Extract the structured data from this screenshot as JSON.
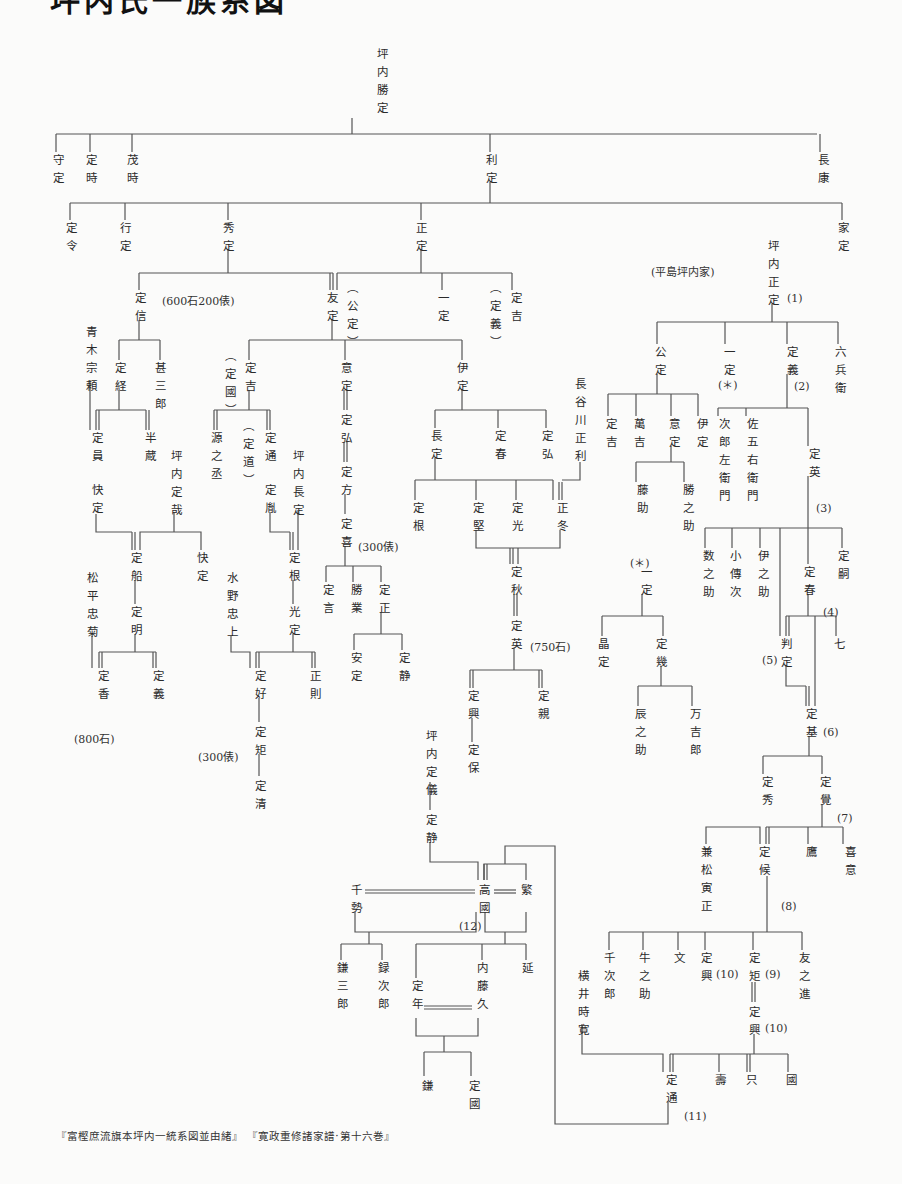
{
  "title": "坪内氏一族系図",
  "footer": "『富樫庶流旗本坪内一統系図並由緒』 『寛政重修諸家譜·第十六巻』",
  "nodes": [
    {
      "id": "katsusada",
      "t": "坪内勝定",
      "x": 376,
      "y": 48
    },
    {
      "id": "morisada",
      "t": "守定",
      "x": 52,
      "y": 154
    },
    {
      "id": "sadatoki",
      "t": "定時",
      "x": 85,
      "y": 154
    },
    {
      "id": "shigetoki",
      "t": "茂時",
      "x": 126,
      "y": 154
    },
    {
      "id": "toshisada",
      "t": "利定",
      "x": 485,
      "y": 154
    },
    {
      "id": "nagayasu",
      "t": "長康",
      "x": 817,
      "y": 154
    },
    {
      "id": "sadanori",
      "t": "定令",
      "x": 65,
      "y": 222
    },
    {
      "id": "yukisada",
      "t": "行定",
      "x": 119,
      "y": 222
    },
    {
      "id": "hidesada",
      "t": "秀定",
      "x": 222,
      "y": 222
    },
    {
      "id": "masasada",
      "t": "正定",
      "x": 415,
      "y": 222
    },
    {
      "id": "iesada",
      "t": "家定",
      "x": 837,
      "y": 222
    },
    {
      "id": "sadanobu",
      "t": "定信",
      "x": 134,
      "y": 292
    },
    {
      "id": "tomosada",
      "t": "友定",
      "x": 326,
      "y": 292
    },
    {
      "id": "kimisada_p",
      "t": "︵公定︶",
      "x": 346,
      "y": 282
    },
    {
      "id": "kazusada",
      "t": "一定",
      "x": 437,
      "y": 292
    },
    {
      "id": "sadayoshi_p",
      "t": "︵定義︶",
      "x": 489,
      "y": 282
    },
    {
      "id": "sadayoshi2",
      "t": "定吉",
      "x": 510,
      "y": 292
    },
    {
      "id": "aoki",
      "t": "青木宗頼",
      "x": 85,
      "y": 326
    },
    {
      "id": "sadatsune",
      "t": "定経",
      "x": 114,
      "y": 362
    },
    {
      "id": "jinzaburo",
      "t": "甚三郎",
      "x": 154,
      "y": 362
    },
    {
      "id": "sadakuni_p",
      "t": "︵定國︶",
      "x": 224,
      "y": 350
    },
    {
      "id": "sadayoshi3",
      "t": "定吉",
      "x": 244,
      "y": 362
    },
    {
      "id": "isada",
      "t": "意定",
      "x": 340,
      "y": 362
    },
    {
      "id": "idasada",
      "t": "伊定",
      "x": 456,
      "y": 362
    },
    {
      "id": "hasegawa",
      "t": "長谷川正利",
      "x": 574,
      "y": 378
    },
    {
      "id": "sadakazu",
      "t": "定員",
      "x": 91,
      "y": 432
    },
    {
      "id": "hanzo",
      "t": "半蔵",
      "x": 144,
      "y": 432
    },
    {
      "id": "gennojo",
      "t": "源之丞",
      "x": 210,
      "y": 432
    },
    {
      "id": "sadamichi_p",
      "t": "︵定道︶",
      "x": 242,
      "y": 420
    },
    {
      "id": "sadamichi",
      "t": "定通",
      "x": 264,
      "y": 432
    },
    {
      "id": "sadahiro1",
      "t": "定弘",
      "x": 340,
      "y": 414
    },
    {
      "id": "nagasada",
      "t": "長定",
      "x": 430,
      "y": 430
    },
    {
      "id": "saharu1",
      "t": "定春",
      "x": 494,
      "y": 430
    },
    {
      "id": "sadahiro2",
      "t": "定弘",
      "x": 541,
      "y": 430
    },
    {
      "id": "tsubouchi_sadachika",
      "t": "坪内定哉",
      "x": 170,
      "y": 450
    },
    {
      "id": "tsubouchi_nagasada",
      "t": "坪内長定",
      "x": 292,
      "y": 450
    },
    {
      "id": "sadakata",
      "t": "定方",
      "x": 340,
      "y": 466
    },
    {
      "id": "kaisada",
      "t": "快定",
      "x": 91,
      "y": 484
    },
    {
      "id": "sadataka",
      "t": "定胤",
      "x": 264,
      "y": 484
    },
    {
      "id": "sadayoshi_k",
      "t": "定喜",
      "x": 340,
      "y": 518
    },
    {
      "id": "sadane1",
      "t": "定根",
      "x": 412,
      "y": 502
    },
    {
      "id": "sadakata2",
      "t": "定堅",
      "x": 472,
      "y": 502
    },
    {
      "id": "sadamitsu",
      "t": "定光",
      "x": 511,
      "y": 502
    },
    {
      "id": "masafuyu",
      "t": "正冬",
      "x": 556,
      "y": 502
    },
    {
      "id": "sadafune",
      "t": "定船",
      "x": 130,
      "y": 552
    },
    {
      "id": "kaisada2",
      "t": "快定",
      "x": 196,
      "y": 552
    },
    {
      "id": "sadane2",
      "t": "定根",
      "x": 288,
      "y": 552
    },
    {
      "id": "sadagen",
      "t": "定言",
      "x": 322,
      "y": 584
    },
    {
      "id": "katsunari",
      "t": "勝業",
      "x": 350,
      "y": 584
    },
    {
      "id": "sadamasa",
      "t": "定正",
      "x": 378,
      "y": 584
    },
    {
      "id": "sadaaki",
      "t": "定秋",
      "x": 510,
      "y": 566
    },
    {
      "id": "matsudaira",
      "t": "松平忠菊",
      "x": 86,
      "y": 572
    },
    {
      "id": "mizuno",
      "t": "水野忠上",
      "x": 226,
      "y": 572
    },
    {
      "id": "sadaaki2",
      "t": "定明",
      "x": 130,
      "y": 606
    },
    {
      "id": "mitsusada",
      "t": "光定",
      "x": 288,
      "y": 606
    },
    {
      "id": "sadahide_e",
      "t": "定英",
      "x": 510,
      "y": 620
    },
    {
      "id": "yasusada",
      "t": "安定",
      "x": 350,
      "y": 652
    },
    {
      "id": "sadashizu",
      "t": "定静",
      "x": 398,
      "y": 652
    },
    {
      "id": "sadaka",
      "t": "定香",
      "x": 97,
      "y": 670
    },
    {
      "id": "sadayoshi4",
      "t": "定義",
      "x": 152,
      "y": 670
    },
    {
      "id": "sadayoshi5",
      "t": "定好",
      "x": 254,
      "y": 670
    },
    {
      "id": "masanori",
      "t": "正則",
      "x": 309,
      "y": 670
    },
    {
      "id": "sadaoki1",
      "t": "定興",
      "x": 467,
      "y": 690
    },
    {
      "id": "sadachika",
      "t": "定親",
      "x": 537,
      "y": 690
    },
    {
      "id": "sadanori2",
      "t": "定矩",
      "x": 254,
      "y": 726
    },
    {
      "id": "sadayasu",
      "t": "定保",
      "x": 467,
      "y": 744
    },
    {
      "id": "tsubouchi_sadanori",
      "t": "坪内定儀",
      "x": 425,
      "y": 730
    },
    {
      "id": "sadakiyo",
      "t": "定清",
      "x": 254,
      "y": 780
    },
    {
      "id": "sadashizu2",
      "t": "定静",
      "x": 425,
      "y": 814
    },
    {
      "id": "chise",
      "t": "千勢",
      "x": 350,
      "y": 884
    },
    {
      "id": "takakuni",
      "t": "高國",
      "x": 478,
      "y": 884
    },
    {
      "id": "shigeru",
      "t": "繁",
      "x": 520,
      "y": 884
    },
    {
      "id": "kamasaburo",
      "t": "鎌三郎",
      "x": 336,
      "y": 962
    },
    {
      "id": "rokujiro",
      "t": "録次郎",
      "x": 377,
      "y": 962
    },
    {
      "id": "naito",
      "t": "内藤久",
      "x": 476,
      "y": 962
    },
    {
      "id": "nobu",
      "t": "延",
      "x": 521,
      "y": 962
    },
    {
      "id": "sadatoshi",
      "t": "定年",
      "x": 411,
      "y": 980
    },
    {
      "id": "kama",
      "t": "鎌",
      "x": 421,
      "y": 1080
    },
    {
      "id": "sadakuni2",
      "t": "定國",
      "x": 468,
      "y": 1080
    },
    {
      "id": "tsubouchi_masasada",
      "t": "坪内正定",
      "x": 767,
      "y": 240
    },
    {
      "id": "kimisada",
      "t": "公定",
      "x": 654,
      "y": 346
    },
    {
      "id": "kazusada2",
      "t": "一定",
      "x": 723,
      "y": 346
    },
    {
      "id": "sadayoshi_h",
      "t": "定義",
      "x": 786,
      "y": 346
    },
    {
      "id": "rokubee",
      "t": "六兵衛",
      "x": 834,
      "y": 346
    },
    {
      "id": "kazusada_star",
      "t": "(＊)",
      "x": 718,
      "y": 376,
      "horiz": true
    },
    {
      "id": "sadayoshi6",
      "t": "定吉",
      "x": 605,
      "y": 418
    },
    {
      "id": "mankichi",
      "t": "萬吉",
      "x": 633,
      "y": 418
    },
    {
      "id": "isada2",
      "t": "意定",
      "x": 668,
      "y": 418
    },
    {
      "id": "idasada2",
      "t": "伊定",
      "x": 696,
      "y": 418
    },
    {
      "id": "jirozaemon",
      "t": "次郎左衛門",
      "x": 718,
      "y": 418
    },
    {
      "id": "sagoemon",
      "t": "佐五右衛門",
      "x": 746,
      "y": 418
    },
    {
      "id": "sadahide",
      "t": "定英",
      "x": 808,
      "y": 448
    },
    {
      "id": "fujisuke",
      "t": "藤助",
      "x": 636,
      "y": 484
    },
    {
      "id": "katsunosuke",
      "t": "勝之助",
      "x": 682,
      "y": 484
    },
    {
      "id": "kazunosuke",
      "t": "数之助",
      "x": 702,
      "y": 550
    },
    {
      "id": "kodenji",
      "t": "小傳次",
      "x": 729,
      "y": 550
    },
    {
      "id": "inosuke",
      "t": "伊之助",
      "x": 757,
      "y": 550
    },
    {
      "id": "saharu2",
      "t": "定春",
      "x": 803,
      "y": 566
    },
    {
      "id": "sadatsugu",
      "t": "定嗣",
      "x": 837,
      "y": 550
    },
    {
      "id": "star_kazusada",
      "t": "一定",
      "x": 640,
      "y": 566
    },
    {
      "id": "masasada2",
      "t": "晶定",
      "x": 597,
      "y": 638
    },
    {
      "id": "sadaiku",
      "t": "定幾",
      "x": 655,
      "y": 638
    },
    {
      "id": "hansada",
      "t": "判定",
      "x": 780,
      "y": 638
    },
    {
      "id": "shichi",
      "t": "七",
      "x": 833,
      "y": 638
    },
    {
      "id": "tatsunosuke",
      "t": "辰之助",
      "x": 634,
      "y": 708
    },
    {
      "id": "mankichiro",
      "t": "万吉郎",
      "x": 689,
      "y": 708
    },
    {
      "id": "sadamoto",
      "t": "定基",
      "x": 805,
      "y": 708
    },
    {
      "id": "sadahide2",
      "t": "定秀",
      "x": 761,
      "y": 776
    },
    {
      "id": "sadasato",
      "t": "定覺",
      "x": 819,
      "y": 776
    },
    {
      "id": "kenmatsu",
      "t": "兼松寅正",
      "x": 700,
      "y": 846
    },
    {
      "id": "sadatoki2",
      "t": "定候",
      "x": 758,
      "y": 846
    },
    {
      "id": "taka",
      "t": "鷹",
      "x": 805,
      "y": 846
    },
    {
      "id": "kii",
      "t": "喜意",
      "x": 844,
      "y": 846
    },
    {
      "id": "senjiro",
      "t": "千次郎",
      "x": 603,
      "y": 952
    },
    {
      "id": "ushinosuke",
      "t": "牛之助",
      "x": 638,
      "y": 952
    },
    {
      "id": "fumi",
      "t": "文",
      "x": 673,
      "y": 952
    },
    {
      "id": "sadaoki2",
      "t": "定興",
      "x": 700,
      "y": 952
    },
    {
      "id": "sadanori3",
      "t": "定矩",
      "x": 748,
      "y": 952
    },
    {
      "id": "tomonoshin",
      "t": "友之進",
      "x": 798,
      "y": 952
    },
    {
      "id": "yokoi",
      "t": "横井時寛",
      "x": 577,
      "y": 970
    },
    {
      "id": "sadaoki3",
      "t": "定興",
      "x": 748,
      "y": 1006
    },
    {
      "id": "sadamichi2",
      "t": "定通",
      "x": 665,
      "y": 1074
    },
    {
      "id": "ju",
      "t": "壽",
      "x": 714,
      "y": 1074
    },
    {
      "id": "tada",
      "t": "只",
      "x": 745,
      "y": 1074
    },
    {
      "id": "kuni",
      "t": "國",
      "x": 785,
      "y": 1074
    }
  ],
  "notes": [
    {
      "t": "(600石200俵)",
      "x": 162,
      "y": 292
    },
    {
      "t": "(平島坪内家)",
      "x": 651,
      "y": 263
    },
    {
      "t": "(1)",
      "x": 787,
      "y": 292
    },
    {
      "t": "(2)",
      "x": 794,
      "y": 380
    },
    {
      "t": "(3)",
      "x": 816,
      "y": 502
    },
    {
      "t": "(＊)",
      "x": 630,
      "y": 554
    },
    {
      "t": "(4)",
      "x": 823,
      "y": 606
    },
    {
      "t": "(5)",
      "x": 762,
      "y": 654
    },
    {
      "t": "(6)",
      "x": 823,
      "y": 726
    },
    {
      "t": "(7)",
      "x": 837,
      "y": 812
    },
    {
      "t": "(8)",
      "x": 781,
      "y": 900
    },
    {
      "t": "(9)",
      "x": 765,
      "y": 968
    },
    {
      "t": "(10)",
      "x": 716,
      "y": 968
    },
    {
      "t": "(10)",
      "x": 765,
      "y": 1022
    },
    {
      "t": "(11)",
      "x": 684,
      "y": 1110
    },
    {
      "t": "(12)",
      "x": 459,
      "y": 920
    },
    {
      "t": "(300俵)",
      "x": 358,
      "y": 538
    },
    {
      "t": "(750石)",
      "x": 530,
      "y": 638
    },
    {
      "t": "(800石)",
      "x": 74,
      "y": 730
    },
    {
      "t": "(300俵)",
      "x": 198,
      "y": 748
    }
  ]
}
